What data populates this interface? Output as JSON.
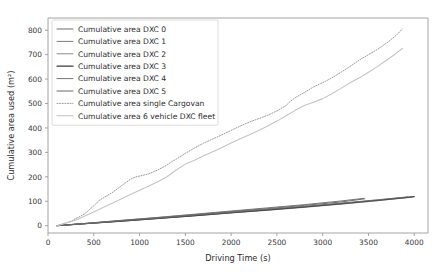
{
  "figure": {
    "background": "#ffffff",
    "width": 448,
    "height": 280
  },
  "chart_data": {
    "type": "line",
    "title": "",
    "xlabel": "Driving Time (s)",
    "ylabel": "Cumulative area used (m²)",
    "xlim": [
      0,
      4150
    ],
    "ylim": [
      -30,
      850
    ],
    "xticks": [
      0,
      500,
      1000,
      1500,
      2000,
      2500,
      3000,
      3500,
      4000
    ],
    "xticklabels": [
      "0",
      "500",
      "1000",
      "1500",
      "2000",
      "2500",
      "3000",
      "3500",
      "4000"
    ],
    "yticks": [
      0,
      100,
      200,
      300,
      400,
      500,
      600,
      700,
      800
    ],
    "yticklabels": [
      "0",
      "100",
      "200",
      "300",
      "400",
      "500",
      "600",
      "700",
      "800"
    ],
    "grid": false,
    "legend_position": "upper left",
    "series": [
      {
        "name": "Cumulative area DXC 0",
        "color": "#6e6e6e",
        "linestyle": "solid",
        "linewidth": 1.0,
        "x": [
          100,
          400,
          800,
          1200,
          1600,
          2000,
          2400,
          2800,
          3200,
          3460
        ],
        "y": [
          0,
          9,
          21,
          33,
          45,
          58,
          70,
          83,
          97,
          110
        ]
      },
      {
        "name": "Cumulative area DXC 1",
        "color": "#7d7d7d",
        "linestyle": "solid",
        "linewidth": 1.0,
        "x": [
          100,
          400,
          800,
          1200,
          1600,
          2000,
          2400,
          2800,
          3200,
          3600,
          3950
        ],
        "y": [
          0,
          8,
          19,
          30,
          42,
          53,
          65,
          77,
          89,
          103,
          116
        ]
      },
      {
        "name": "Cumulative area DXC 2",
        "color": "#8c8c8c",
        "linestyle": "solid",
        "linewidth": 1.0,
        "x": [
          100,
          400,
          800,
          1200,
          1600,
          2000,
          2400,
          2800,
          3200,
          3600,
          3980
        ],
        "y": [
          0,
          8,
          18,
          29,
          40,
          52,
          63,
          75,
          88,
          102,
          117
        ]
      },
      {
        "name": "Cumulative area DXC 3",
        "color": "#3c3c3c",
        "linestyle": "solid",
        "linewidth": 1.2,
        "x": [
          100,
          400,
          800,
          1200,
          1600,
          2000,
          2400,
          2800,
          3200,
          3600,
          4000
        ],
        "y": [
          0,
          8,
          19,
          30,
          41,
          53,
          65,
          77,
          90,
          104,
          119
        ]
      },
      {
        "name": "Cumulative area DXC 4",
        "color": "#757575",
        "linestyle": "solid",
        "linewidth": 1.0,
        "x": [
          100,
          400,
          800,
          1200,
          1600,
          2000,
          2400,
          2800,
          3200,
          3450
        ],
        "y": [
          0,
          9,
          22,
          34,
          47,
          60,
          73,
          86,
          101,
          112
        ]
      },
      {
        "name": "Cumulative area DXC 5",
        "color": "#6a6a6a",
        "linestyle": "solid",
        "linewidth": 1.0,
        "x": [
          100,
          400,
          800,
          1200,
          1600,
          2000,
          2400,
          2800,
          3200,
          3600,
          3930
        ],
        "y": [
          0,
          8,
          20,
          31,
          43,
          55,
          67,
          79,
          92,
          106,
          118
        ]
      },
      {
        "name": "Cumulative area single Cargovan",
        "color": "#9b9b9b",
        "linestyle": "dotted",
        "linewidth": 1.0,
        "x": [
          100,
          250,
          400,
          520,
          560,
          700,
          820,
          900,
          960,
          1000,
          1100,
          1200,
          1300,
          1350,
          1400,
          1500,
          1600,
          1700,
          1800,
          1900,
          2000,
          2100,
          2200,
          2300,
          2400,
          2500,
          2600,
          2650,
          2700,
          2800,
          2900,
          3000,
          3100,
          3200,
          3300,
          3400,
          3500,
          3600,
          3700,
          3800,
          3870
        ],
        "y": [
          0,
          18,
          48,
          88,
          104,
          135,
          168,
          190,
          200,
          203,
          212,
          228,
          248,
          262,
          272,
          296,
          318,
          338,
          355,
          372,
          390,
          408,
          424,
          438,
          452,
          470,
          492,
          510,
          524,
          545,
          568,
          585,
          605,
          628,
          652,
          678,
          700,
          722,
          748,
          778,
          805
        ]
      },
      {
        "name": "Cumulative area 6 vehicle DXC fleet",
        "color": "#c4c4c4",
        "linestyle": "solid",
        "linewidth": 1.1,
        "x": [
          100,
          300,
          500,
          700,
          900,
          1000,
          1100,
          1200,
          1300,
          1400,
          1500,
          1600,
          1700,
          1800,
          1900,
          2000,
          2100,
          2200,
          2300,
          2400,
          2500,
          2600,
          2700,
          2800,
          2900,
          3000,
          3100,
          3200,
          3300,
          3400,
          3500,
          3600,
          3700,
          3800,
          3870
        ],
        "y": [
          0,
          22,
          56,
          92,
          128,
          145,
          162,
          180,
          200,
          228,
          252,
          268,
          286,
          303,
          320,
          338,
          356,
          372,
          390,
          408,
          428,
          450,
          472,
          492,
          505,
          520,
          540,
          562,
          585,
          605,
          628,
          652,
          678,
          705,
          725
        ]
      }
    ]
  },
  "legend": {
    "entries": [
      {
        "label": "Cumulative area DXC 0"
      },
      {
        "label": "Cumulative area DXC 1"
      },
      {
        "label": "Cumulative area DXC 2"
      },
      {
        "label": "Cumulative area DXC 3"
      },
      {
        "label": "Cumulative area DXC 4"
      },
      {
        "label": "Cumulative area DXC 5"
      },
      {
        "label": "Cumulative area single Cargovan"
      },
      {
        "label": "Cumulative area 6 vehicle DXC fleet"
      }
    ]
  }
}
